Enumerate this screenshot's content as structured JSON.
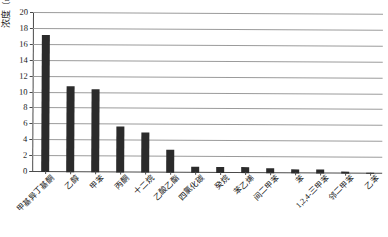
{
  "chart_data": {
    "type": "bar",
    "title": "",
    "xlabel": "",
    "ylabel": "浓度（mg/m³）",
    "ylabel_text": "浓度",
    "ylabel_unit": "（mg/m",
    "ylabel_unit_sup": "3",
    "ylabel_unit_close": "）",
    "ylim": [
      0,
      20
    ],
    "ytick_step": 2,
    "yticks": [
      0,
      2,
      4,
      6,
      8,
      10,
      12,
      14,
      16,
      18,
      20
    ],
    "ytick_labels": [
      "0",
      "2",
      "4",
      "6",
      "8",
      "10",
      "12",
      "14",
      "16",
      "18",
      "20"
    ],
    "grid": true,
    "grid_axis": "y",
    "legend": false,
    "bar_color": "#2b2b2b",
    "categories": [
      "甲基异丁基酮",
      "乙醇",
      "甲苯",
      "丙酮",
      "十二烷",
      "乙酸乙酯",
      "四氯化碳",
      "癸烷",
      "苯乙烯",
      "间二甲苯",
      "苯",
      "1,2,4-三甲苯",
      "邻二甲苯",
      "乙苯"
    ],
    "values": [
      17.2,
      10.8,
      10.4,
      5.8,
      5.0,
      2.9,
      0.8,
      0.75,
      0.7,
      0.6,
      0.55,
      0.45,
      0.3,
      0.15
    ]
  }
}
